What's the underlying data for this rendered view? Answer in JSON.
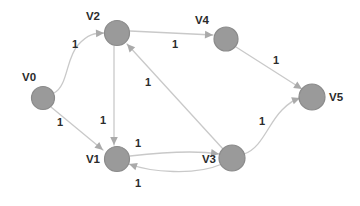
{
  "graph": {
    "type": "directed-weighted-graph",
    "background_color": "#ffffff",
    "node_fill": "#9a9a9a",
    "node_stroke": "#8a8a8a",
    "edge_color": "#c9c9c9",
    "arrow_color": "#aaaaaa",
    "label_color": "#2b2b2b",
    "nodes": [
      {
        "id": "V0",
        "label": "V0",
        "cx": 43,
        "cy": 98,
        "r": 11.5,
        "label_x": 22,
        "label_y": 81,
        "label_anchor": "start"
      },
      {
        "id": "V1",
        "label": "V1",
        "cx": 117,
        "cy": 159,
        "r": 12.5,
        "label_x": 100,
        "label_y": 163,
        "label_anchor": "end"
      },
      {
        "id": "V2",
        "label": "V2",
        "cx": 117,
        "cy": 33,
        "r": 12.5,
        "label_x": 100,
        "label_y": 20,
        "label_anchor": "end"
      },
      {
        "id": "V3",
        "label": "V3",
        "cx": 232,
        "cy": 158,
        "r": 13.0,
        "label_x": 216,
        "label_y": 163,
        "label_anchor": "end"
      },
      {
        "id": "V4",
        "label": "V4",
        "cx": 226,
        "cy": 39,
        "r": 12.0,
        "label_x": 209,
        "label_y": 24,
        "label_anchor": "end"
      },
      {
        "id": "V5",
        "label": "V5",
        "cx": 312,
        "cy": 97,
        "r": 13.0,
        "label_x": 329,
        "label_y": 101,
        "label_anchor": "start"
      }
    ],
    "edges": [
      {
        "id": "e-v0-v2",
        "from": "V0",
        "to": "V2",
        "weight": "1",
        "label_x": 75,
        "label_y": 48,
        "path": "M 54 93 C 68 86 66 58 78 45 C 88 34 95 33 104 33"
      },
      {
        "id": "e-v0-v1",
        "from": "V0",
        "to": "V1",
        "weight": "1",
        "label_x": 60,
        "label_y": 126,
        "path": "M 51 107 L 103 150"
      },
      {
        "id": "e-v2-v1",
        "from": "V2",
        "to": "V1",
        "weight": "1",
        "label_x": 103,
        "label_y": 124,
        "path": "M 114 46 L 114 145"
      },
      {
        "id": "e-v2-v4",
        "from": "V2",
        "to": "V4",
        "weight": "1",
        "label_x": 175,
        "label_y": 48,
        "path": "M 130 31 L 213 35"
      },
      {
        "id": "e-v1-v3",
        "from": "V1",
        "to": "V3",
        "weight": "1",
        "label_x": 138,
        "label_y": 147,
        "path": "M 130 156 C 165 152 195 150 219 154"
      },
      {
        "id": "e-v3-v1",
        "from": "V3",
        "to": "V1",
        "weight": "1",
        "label_x": 138,
        "label_y": 187,
        "path": "M 222 164 C 195 176 150 172 129 164"
      },
      {
        "id": "e-v3-v2",
        "from": "V3",
        "to": "V2",
        "weight": "1",
        "label_x": 148,
        "label_y": 86,
        "path": "M 223 149 L 127 44"
      },
      {
        "id": "e-v4-v5",
        "from": "V4",
        "to": "V5",
        "weight": "1",
        "label_x": 276,
        "label_y": 64,
        "path": "M 236 47 L 302 89"
      },
      {
        "id": "e-v3-v5",
        "from": "V3",
        "to": "V5",
        "weight": "1",
        "label_x": 262,
        "label_y": 125,
        "path": "M 244 154 C 262 148 268 124 282 110 C 290 102 295 99 300 98"
      }
    ]
  }
}
